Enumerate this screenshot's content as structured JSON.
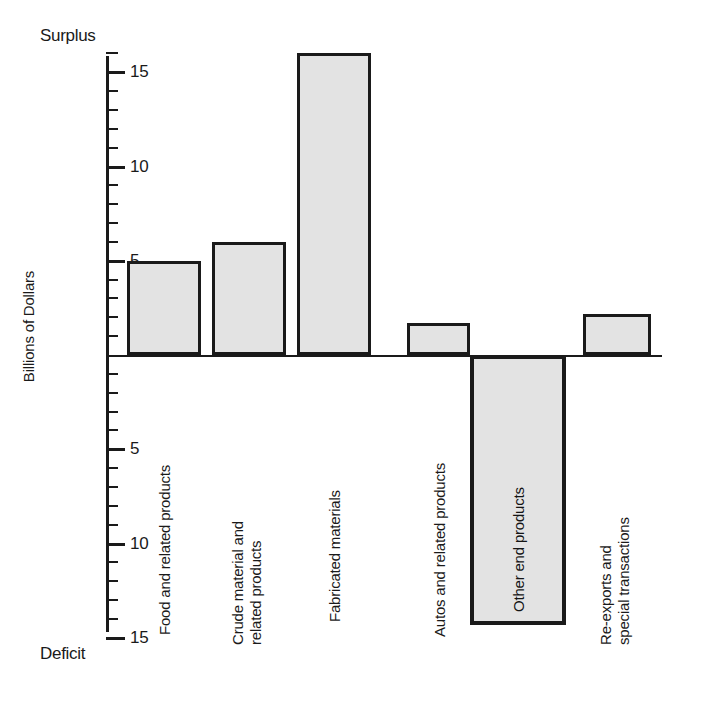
{
  "chart_data": {
    "type": "bar",
    "title": "",
    "xlabel": "",
    "ylabel": "Billions of Dollars",
    "ylim": [
      -15,
      17
    ],
    "grid": false,
    "legend": "none",
    "orientation": "vertical",
    "axis_top_caption": "Surplus",
    "axis_bottom_caption": "Deficit",
    "tick_labels_positive": [
      "5",
      "10",
      "15"
    ],
    "tick_labels_negative": [
      "5",
      "10",
      "15"
    ],
    "tick_values_positive": [
      5,
      10,
      15
    ],
    "tick_values_negative": [
      -5,
      -10,
      -15
    ],
    "minor_tick_interval": 1,
    "categories": [
      "Food and related products",
      "Crude material and related products",
      "Fabricated materials",
      "Autos and related products",
      "Other end products",
      "Re-exports and special transactions"
    ],
    "category_lines": [
      [
        "Food and related products"
      ],
      [
        "Crude material and",
        "related products"
      ],
      [
        "Fabricated materials"
      ],
      [
        "Autos and related products"
      ],
      [
        "Other end products"
      ],
      [
        "Re-exports and",
        "special transactions"
      ]
    ],
    "values": [
      5.0,
      6.0,
      16.0,
      1.7,
      -14.3,
      2.2
    ],
    "bar_fill_color": "#e3e3e3",
    "bar_edge_color": "#1a1a1a",
    "units": "Billions of Dollars"
  },
  "axis": {
    "y_title": "Billions of Dollars",
    "surplus_caption": "Surplus",
    "deficit_caption": "Deficit",
    "ticks": [
      {
        "label": "15",
        "value": 15
      },
      {
        "label": "10",
        "value": 10
      },
      {
        "label": "5",
        "value": 5
      },
      {
        "label": "5",
        "value": -5
      },
      {
        "label": "10",
        "value": -10
      },
      {
        "label": "15",
        "value": -15
      }
    ]
  },
  "bars": [
    {
      "name": "bar-food",
      "line1": "Food and related products",
      "line2": "",
      "value": 5.0
    },
    {
      "name": "bar-crude",
      "line1": "Crude material and",
      "line2": "related products",
      "value": 6.0
    },
    {
      "name": "bar-fabricated",
      "line1": "Fabricated materials",
      "line2": "",
      "value": 16.0
    },
    {
      "name": "bar-autos",
      "line1": "Autos and related products",
      "line2": "",
      "value": 1.7
    },
    {
      "name": "bar-other-end",
      "line1": "Other end products",
      "line2": "",
      "value": -14.3
    },
    {
      "name": "bar-reexports",
      "line1": "Re-exports and",
      "line2": "special transactions",
      "value": 2.2
    }
  ]
}
